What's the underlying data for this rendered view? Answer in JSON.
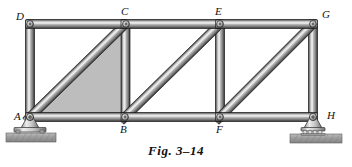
{
  "figure": {
    "caption": "Fig. 3–14",
    "type": "pin-jointed plane truss"
  },
  "colors": {
    "member_dark": "#3f3f3f",
    "member_mid": "#8e8e8e",
    "member_light": "#e8e8e8",
    "member_edge": "#1c1c1c",
    "shaded_region": "#b9b9b9",
    "ground": "#9a9a9a",
    "support_body": "#d0d0d0",
    "pin_hole": "#6a6a6a",
    "label_text": "#111111",
    "background": "#ffffff"
  },
  "joints": [
    {
      "id": "D",
      "label": "D",
      "x": 30,
      "y": 24,
      "label_x": 16,
      "label_y": 11,
      "chord": "top"
    },
    {
      "id": "C",
      "label": "C",
      "x": 126,
      "y": 24,
      "label_x": 121,
      "label_y": 6,
      "chord": "top"
    },
    {
      "id": "E",
      "label": "E",
      "x": 220,
      "y": 24,
      "label_x": 215,
      "label_y": 6,
      "chord": "top"
    },
    {
      "id": "G",
      "label": "G",
      "x": 313,
      "y": 24,
      "label_x": 322,
      "label_y": 9,
      "chord": "top"
    },
    {
      "id": "A",
      "label": "A",
      "x": 30,
      "y": 117,
      "label_x": 14,
      "label_y": 111,
      "chord": "bottom"
    },
    {
      "id": "B",
      "label": "B",
      "x": 125,
      "y": 117,
      "label_x": 120,
      "label_y": 124,
      "chord": "bottom"
    },
    {
      "id": "F",
      "label": "F",
      "x": 220,
      "y": 117,
      "label_x": 216,
      "label_y": 124,
      "chord": "bottom"
    },
    {
      "id": "H",
      "label": "H",
      "x": 313,
      "y": 117,
      "label_x": 327,
      "label_y": 110,
      "chord": "bottom"
    }
  ],
  "members": [
    {
      "id": "DC",
      "from": "D",
      "to": "C",
      "kind": "top-chord",
      "width": 9
    },
    {
      "id": "CE",
      "from": "C",
      "to": "E",
      "kind": "top-chord",
      "width": 9
    },
    {
      "id": "EG",
      "from": "E",
      "to": "G",
      "kind": "top-chord",
      "width": 9
    },
    {
      "id": "AB",
      "from": "A",
      "to": "B",
      "kind": "bottom-chord",
      "width": 9
    },
    {
      "id": "BF",
      "from": "B",
      "to": "F",
      "kind": "bottom-chord",
      "width": 9
    },
    {
      "id": "FH",
      "from": "F",
      "to": "H",
      "kind": "bottom-chord",
      "width": 9
    },
    {
      "id": "DA",
      "from": "D",
      "to": "A",
      "kind": "vertical",
      "width": 9
    },
    {
      "id": "CB",
      "from": "C",
      "to": "B",
      "kind": "vertical",
      "width": 9
    },
    {
      "id": "EF",
      "from": "E",
      "to": "F",
      "kind": "vertical",
      "width": 9
    },
    {
      "id": "GH",
      "from": "G",
      "to": "H",
      "kind": "vertical",
      "width": 9
    },
    {
      "id": "AC",
      "from": "A",
      "to": "C",
      "kind": "diagonal",
      "width": 9
    },
    {
      "id": "BE",
      "from": "B",
      "to": "E",
      "kind": "diagonal",
      "width": 9
    },
    {
      "id": "FG",
      "from": "F",
      "to": "G",
      "kind": "diagonal",
      "width": 9
    }
  ],
  "shaded_panel": {
    "name": "panel-ABC-shaded",
    "vertices": [
      "A",
      "B",
      "C"
    ],
    "points": "30,117 125,117 126,24"
  },
  "supports": [
    {
      "id": "support-A",
      "at_joint": "A",
      "type": "pin",
      "x": 30,
      "base_y": 128,
      "ground_y": 133,
      "ground_x": 6,
      "ground_w": 50,
      "ground_h": 9
    },
    {
      "id": "support-H",
      "at_joint": "H",
      "type": "roller",
      "x": 313,
      "base_y": 128,
      "ground_y": 134,
      "ground_x": 290,
      "ground_w": 52,
      "ground_h": 9,
      "roller_count": 4
    }
  ]
}
